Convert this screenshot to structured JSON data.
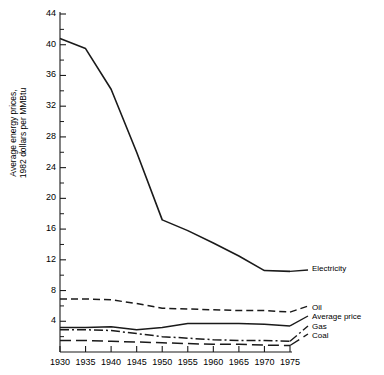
{
  "figure": {
    "background": "#ffffff",
    "line_color": "#1a1a1a"
  },
  "axes": {
    "y_axis_label_line1": "Average energy prices,",
    "y_axis_label_line2": "1982 dollars per MMBtu",
    "y_ticks_major": [
      4,
      8,
      12,
      16,
      20,
      24,
      28,
      32,
      36,
      40,
      44
    ],
    "y_ticks_minor": [
      2,
      6,
      10,
      14,
      18,
      22,
      26,
      30,
      34,
      38,
      42
    ],
    "y_min": 0,
    "y_max": 44,
    "x_ticks": [
      1930,
      1935,
      1940,
      1945,
      1950,
      1955,
      1960,
      1965,
      1970,
      1975
    ],
    "x_min": 1930,
    "x_max": 1975
  },
  "legend": {
    "electricity": "Electricity",
    "oil": "Oil",
    "average_price": "Average price",
    "gas": "Gas",
    "coal": "Coal"
  },
  "chart_data": {
    "type": "line",
    "title": "",
    "xlabel": "",
    "ylabel": "Average energy prices, 1982 dollars per MMBtu",
    "xlim": [
      1930,
      1975
    ],
    "ylim": [
      0,
      44
    ],
    "grid": false,
    "legend_position": "right-inline-labels",
    "x": [
      1930,
      1935,
      1940,
      1945,
      1950,
      1955,
      1960,
      1965,
      1970,
      1975
    ],
    "series": [
      {
        "name": "Electricity",
        "style": "solid",
        "values": [
          40.8,
          39.5,
          34.2,
          26.0,
          17.2,
          15.8,
          14.2,
          12.5,
          10.6,
          10.5
        ]
      },
      {
        "name": "Oil",
        "style": "dashed",
        "values": [
          6.9,
          6.9,
          6.8,
          6.3,
          5.7,
          5.6,
          5.5,
          5.4,
          5.4,
          5.2
        ]
      },
      {
        "name": "Average price",
        "style": "solid",
        "values": [
          3.2,
          3.2,
          3.3,
          2.9,
          3.2,
          3.7,
          3.7,
          3.7,
          3.6,
          3.4
        ]
      },
      {
        "name": "Gas",
        "style": "dash-dot",
        "values": [
          2.9,
          2.9,
          2.8,
          2.4,
          2.0,
          1.8,
          1.6,
          1.5,
          1.5,
          1.4
        ]
      },
      {
        "name": "Coal",
        "style": "long-dash",
        "values": [
          1.5,
          1.5,
          1.4,
          1.3,
          1.2,
          1.1,
          1.0,
          1.0,
          0.9,
          0.85
        ]
      }
    ]
  }
}
